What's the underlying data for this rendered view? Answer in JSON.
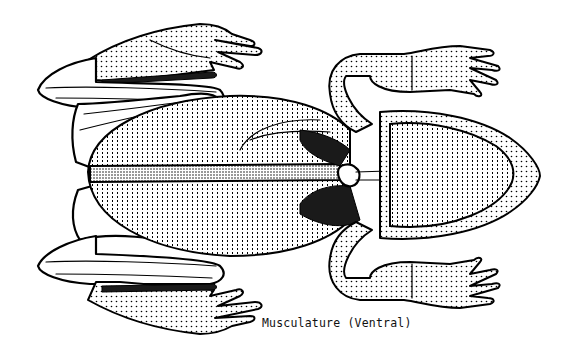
{
  "figure": {
    "view": "ventral",
    "caption": "Musculature (Ventral)",
    "colors": {
      "background": "#ffffff",
      "ink": "#000000"
    }
  }
}
